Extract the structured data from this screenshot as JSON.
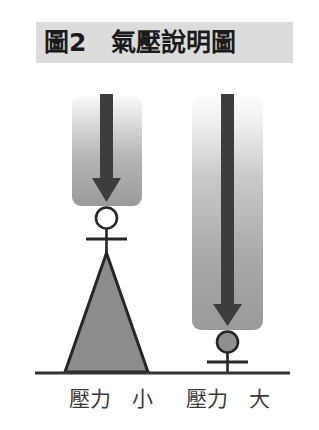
{
  "figure": {
    "title_label": "圖2",
    "title_subject": "氣壓說明圖",
    "title_full": "圖2　氣壓說明圖",
    "title_band_color": "#dcdcdc",
    "background_color": "#ffffff"
  },
  "scene": {
    "ground_label": "ground-line",
    "ground_color": "#333333",
    "arrow_color": "#3a3a3a",
    "block_gradient_top": "#f7f7f7",
    "block_gradient_bottom": "#9a9a9a",
    "triangle_fill": "#8c8c8c",
    "outline_color": "#262626"
  },
  "left_panel": {
    "caption": "壓力　小",
    "caption_pressure": "壓力",
    "caption_magnitude": "小",
    "support_shape": "triangle",
    "ball_fill": "#ffffff",
    "arrow_length_label": "short",
    "block_height_px": 110
  },
  "right_panel": {
    "caption": "壓力　大",
    "caption_pressure": "壓力",
    "caption_magnitude": "大",
    "support_shape": "post",
    "ball_fill": "#8f8f8f",
    "arrow_length_label": "long",
    "block_height_px": 234
  }
}
